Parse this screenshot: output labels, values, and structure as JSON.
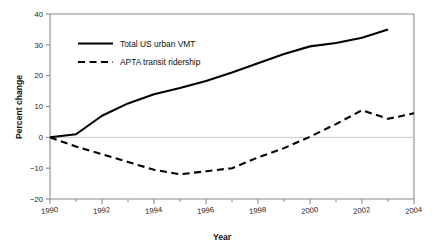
{
  "chart_data": {
    "type": "line",
    "title": "",
    "xlabel": "Year",
    "ylabel": "Percent change",
    "xlim": [
      1990,
      2004
    ],
    "ylim": [
      -20,
      40
    ],
    "grid": false,
    "zero_line": true,
    "legend_position": "top-left inside",
    "x_major_ticks": [
      1990,
      1992,
      1994,
      1996,
      1998,
      2000,
      2002,
      2004
    ],
    "x_tick_labels": [
      "1990",
      "1992",
      "1994",
      "1996",
      "1998",
      "2000",
      "2002",
      "2004"
    ],
    "x_minor_ticks": [
      1991,
      1993,
      1995,
      1997,
      1999,
      2001,
      2003
    ],
    "y_ticks": [
      -20,
      -10,
      0,
      10,
      20,
      30,
      40
    ],
    "y_tick_labels": [
      "−20",
      "−10",
      "0",
      "10",
      "20",
      "30",
      "40"
    ],
    "x": [
      1990,
      1991,
      1992,
      1993,
      1994,
      1995,
      1996,
      1997,
      1998,
      1999,
      2000,
      2001,
      2002,
      2003,
      2004
    ],
    "series": [
      {
        "name": "Total US urban VMT",
        "style": "solid",
        "color": "#000000",
        "x": [
          1990,
          1991,
          1992,
          1993,
          1994,
          1995,
          1996,
          1997,
          1998,
          1999,
          2000,
          2001,
          2002,
          2003
        ],
        "values": [
          0,
          1,
          7,
          11,
          14,
          16,
          18.3,
          21,
          24,
          27,
          29.5,
          30.6,
          32.3,
          35
        ]
      },
      {
        "name": "APTA transit ridership",
        "style": "dashed",
        "color": "#000000",
        "x": [
          1990,
          1991,
          1992,
          1993,
          1994,
          1995,
          1996,
          1997,
          1998,
          1999,
          2000,
          2001,
          2002,
          2003,
          2004
        ],
        "values": [
          0,
          -3,
          -5.5,
          -8,
          -10.5,
          -12,
          -11,
          -10,
          -6.5,
          -3.5,
          0.2,
          4.3,
          8.8,
          6,
          7.8
        ]
      }
    ]
  },
  "legend": {
    "items": [
      {
        "label": "Total US urban VMT",
        "style": "solid"
      },
      {
        "label": "APTA transit ridership",
        "style": "dashed"
      }
    ]
  },
  "axes": {
    "x_title": "Year",
    "y_title": "Percent change"
  },
  "colors": {
    "line": "#000000",
    "frame": "#8c8c8c",
    "zero_line": "#c9c9c9",
    "background": "#ffffff"
  }
}
